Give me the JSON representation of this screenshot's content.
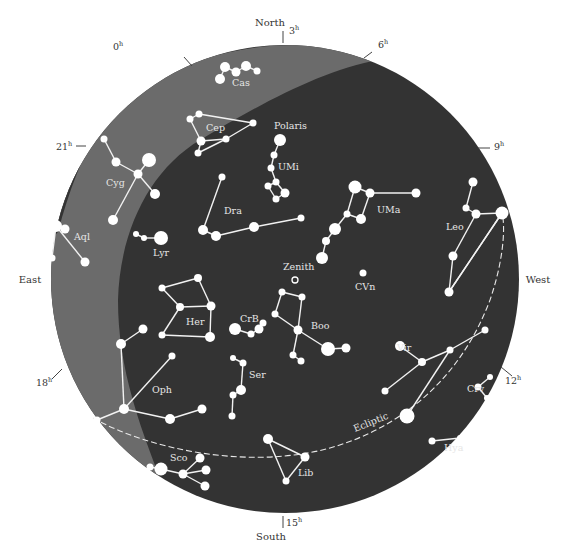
{
  "map": {
    "title": "Star map",
    "colors": {
      "sky": "#333333",
      "milky_way": "#6b6b6b",
      "background": "#ffffff",
      "star": "#ffffff",
      "line": "#f2f2f2"
    },
    "directions": [
      {
        "id": "north",
        "label": "North",
        "x": 270,
        "y": 26
      },
      {
        "id": "south",
        "label": "South",
        "x": 271,
        "y": 540
      },
      {
        "id": "east",
        "label": "East",
        "x": 30,
        "y": 283
      },
      {
        "id": "west",
        "label": "West",
        "x": 538,
        "y": 283
      }
    ],
    "hour_marks": [
      {
        "label": "0",
        "x": 113,
        "y": 50,
        "tx1": 184,
        "ty1": 57,
        "tx2": 192,
        "ty2": 66
      },
      {
        "label": "3",
        "x": 289,
        "y": 34,
        "tx1": 283,
        "ty1": 31,
        "tx2": 283,
        "ty2": 43
      },
      {
        "label": "6",
        "x": 378,
        "y": 48,
        "tx1": 369,
        "ty1": 53,
        "tx2": 369,
        "ty2": 53
      },
      {
        "label": "9",
        "x": 494,
        "y": 150,
        "tx1": 478,
        "ty1": 148,
        "tx2": 490,
        "ty2": 148
      },
      {
        "label": "12",
        "x": 505,
        "y": 384,
        "tx1": 501,
        "ty1": 367,
        "tx2": 512,
        "ty2": 376
      },
      {
        "label": "15",
        "x": 286,
        "y": 526,
        "tx1": 283,
        "ty1": 516,
        "tx2": 283,
        "ty2": 528
      },
      {
        "label": "18",
        "x": 36,
        "y": 386,
        "tx1": 52,
        "ty1": 379,
        "tx2": 62,
        "ty2": 369
      },
      {
        "label": "21",
        "x": 56,
        "y": 150,
        "tx1": 76,
        "ty1": 146,
        "tx2": 86,
        "ty2": 146
      }
    ],
    "hour_superscript": "h",
    "zenith": {
      "label": "Zenith",
      "x": 295,
      "y": 280,
      "lx": 283,
      "ly": 270
    },
    "ecliptic": {
      "label": "Ecliptic",
      "x": 355,
      "y": 432,
      "rotate": -22
    },
    "constellations": [
      {
        "name": "Cas",
        "lx": 232,
        "ly": 86,
        "stars": [
          [
            220,
            79,
            5
          ],
          [
            225,
            67,
            5
          ],
          [
            236,
            72,
            4.5
          ],
          [
            246,
            66,
            5
          ],
          [
            257,
            71,
            3.5
          ]
        ],
        "lines": [
          [
            0,
            1
          ],
          [
            1,
            2
          ],
          [
            2,
            3
          ],
          [
            3,
            4
          ]
        ]
      },
      {
        "name": "Cep",
        "lx": 206,
        "ly": 131,
        "stars": [
          [
            190,
            119,
            3.5
          ],
          [
            199,
            114,
            3.5
          ],
          [
            253,
            123,
            3.5
          ],
          [
            226,
            139,
            3.5
          ],
          [
            201,
            141,
            4.5
          ],
          [
            198,
            153,
            3.5
          ]
        ],
        "lines": [
          [
            0,
            1
          ],
          [
            1,
            2
          ],
          [
            2,
            3
          ],
          [
            3,
            4
          ],
          [
            4,
            5
          ],
          [
            0,
            4
          ],
          [
            5,
            3
          ]
        ]
      },
      {
        "name": "Polaris",
        "lx": 274,
        "ly": 129,
        "stars": [],
        "lines": []
      },
      {
        "name": "UMi",
        "lx": 278,
        "ly": 170,
        "stars": [
          [
            280,
            140,
            6
          ],
          [
            274,
            155,
            3.5
          ],
          [
            271,
            168,
            3.5
          ],
          [
            276,
            182,
            3.5
          ],
          [
            268,
            186,
            3.5
          ],
          [
            285,
            193,
            4.5
          ],
          [
            276,
            199,
            3.5
          ]
        ],
        "lines": [
          [
            0,
            1
          ],
          [
            1,
            2
          ],
          [
            2,
            3
          ],
          [
            3,
            4
          ],
          [
            3,
            5
          ],
          [
            5,
            6
          ],
          [
            6,
            4
          ]
        ]
      },
      {
        "name": "Dra",
        "lx": 224,
        "ly": 214,
        "stars": [
          [
            222,
            177,
            3.5
          ],
          [
            203,
            230,
            5
          ],
          [
            216,
            236,
            5
          ],
          [
            254,
            227,
            5
          ],
          [
            301,
            218,
            3.5
          ]
        ],
        "lines": [
          [
            0,
            1
          ],
          [
            1,
            2
          ],
          [
            2,
            3
          ],
          [
            3,
            4
          ]
        ]
      },
      {
        "name": "UMa",
        "lx": 377,
        "ly": 213,
        "stars": [
          [
            355,
            187,
            6.5
          ],
          [
            370,
            193,
            4.5
          ],
          [
            416,
            193,
            4.5
          ],
          [
            347,
            214,
            3.5
          ],
          [
            361,
            219,
            5
          ],
          [
            335,
            229,
            6
          ],
          [
            326,
            241,
            4
          ],
          [
            322,
            258,
            6
          ]
        ],
        "lines": [
          [
            0,
            1
          ],
          [
            1,
            2
          ],
          [
            0,
            3
          ],
          [
            1,
            4
          ],
          [
            3,
            4
          ],
          [
            3,
            5
          ],
          [
            5,
            6
          ],
          [
            6,
            7
          ]
        ]
      },
      {
        "name": "CVn",
        "lx": 355,
        "ly": 290,
        "stars": [
          [
            363,
            273,
            3.5
          ]
        ],
        "lines": []
      },
      {
        "name": "Leo",
        "lx": 446,
        "ly": 230,
        "stars": [
          [
            473,
            182,
            4.5
          ],
          [
            466,
            208,
            3.5
          ],
          [
            476,
            214,
            4.5
          ],
          [
            502,
            213,
            6.5
          ],
          [
            453,
            256,
            4.5
          ],
          [
            449,
            292,
            4.5
          ]
        ],
        "lines": [
          [
            0,
            1
          ],
          [
            1,
            2
          ],
          [
            2,
            3
          ],
          [
            2,
            4
          ],
          [
            4,
            5
          ],
          [
            5,
            3
          ]
        ]
      },
      {
        "name": "Cyg",
        "lx": 106,
        "ly": 186,
        "stars": [
          [
            104,
            139,
            3.5
          ],
          [
            116,
            162,
            4.5
          ],
          [
            149,
            160,
            7
          ],
          [
            138,
            174,
            4.5
          ],
          [
            155,
            194,
            5
          ],
          [
            113,
            220,
            5
          ]
        ],
        "lines": [
          [
            0,
            1
          ],
          [
            1,
            3
          ],
          [
            2,
            3
          ],
          [
            3,
            4
          ],
          [
            3,
            5
          ]
        ]
      },
      {
        "name": "Aql",
        "lx": 74,
        "ly": 240,
        "stars": [
          [
            56,
            226,
            6
          ],
          [
            65,
            229,
            4.5
          ],
          [
            52,
            258,
            3.5
          ],
          [
            85,
            262,
            4.5
          ]
        ],
        "lines": [
          [
            0,
            1
          ],
          [
            0,
            2
          ],
          [
            0,
            3
          ]
        ]
      },
      {
        "name": "Lyr",
        "lx": 153,
        "ly": 256,
        "stars": [
          [
            136,
            234,
            3
          ],
          [
            144,
            238,
            3
          ],
          [
            161,
            238,
            7
          ]
        ],
        "lines": [
          [
            0,
            1
          ],
          [
            1,
            2
          ]
        ]
      },
      {
        "name": "Her",
        "lx": 186,
        "ly": 325,
        "stars": [
          [
            162,
            288,
            3.5
          ],
          [
            198,
            278,
            4
          ],
          [
            180,
            307,
            4
          ],
          [
            211,
            306,
            4.5
          ],
          [
            162,
            335,
            3.5
          ],
          [
            210,
            337,
            5
          ]
        ],
        "lines": [
          [
            0,
            2
          ],
          [
            1,
            3
          ],
          [
            0,
            1
          ],
          [
            2,
            3
          ],
          [
            2,
            4
          ],
          [
            4,
            5
          ],
          [
            3,
            5
          ]
        ]
      },
      {
        "name": "CrB",
        "lx": 240,
        "ly": 322,
        "stars": [
          [
            235,
            329,
            6
          ],
          [
            251,
            334,
            3.5
          ],
          [
            259,
            329,
            4.5
          ],
          [
            263,
            323,
            3.5
          ]
        ],
        "lines": [
          [
            0,
            1
          ],
          [
            1,
            2
          ],
          [
            2,
            3
          ]
        ]
      },
      {
        "name": "Boo",
        "lx": 311,
        "ly": 329,
        "stars": [
          [
            282,
            292,
            3.5
          ],
          [
            302,
            297,
            3.5
          ],
          [
            275,
            314,
            3.5
          ],
          [
            298,
            330,
            4.5
          ],
          [
            328,
            349,
            7
          ],
          [
            346,
            348,
            4.5
          ],
          [
            293,
            355,
            3.5
          ],
          [
            301,
            361,
            3.5
          ]
        ],
        "lines": [
          [
            0,
            1
          ],
          [
            0,
            2
          ],
          [
            1,
            3
          ],
          [
            2,
            3
          ],
          [
            3,
            4
          ],
          [
            4,
            5
          ],
          [
            3,
            6
          ],
          [
            6,
            7
          ]
        ]
      },
      {
        "name": "Ser",
        "lx": 249,
        "ly": 378,
        "stars": [
          [
            233,
            358,
            3
          ],
          [
            243,
            363,
            3.5
          ],
          [
            241,
            390,
            5
          ],
          [
            233,
            395,
            3.5
          ],
          [
            232,
            416,
            3.5
          ]
        ],
        "lines": [
          [
            0,
            1
          ],
          [
            1,
            2
          ],
          [
            2,
            3
          ],
          [
            3,
            4
          ]
        ]
      },
      {
        "name": "Oph",
        "lx": 152,
        "ly": 393,
        "stars": [
          [
            143,
            329,
            4.5
          ],
          [
            121,
            344,
            5
          ],
          [
            172,
            356,
            3.5
          ],
          [
            124,
            409,
            5
          ],
          [
            170,
            419,
            5
          ],
          [
            202,
            409,
            4.5
          ],
          [
            97,
            420,
            3.5
          ]
        ],
        "lines": [
          [
            0,
            1
          ],
          [
            1,
            3
          ],
          [
            2,
            3
          ],
          [
            3,
            4
          ],
          [
            4,
            5
          ],
          [
            3,
            6
          ]
        ]
      },
      {
        "name": "Sco",
        "lx": 170,
        "ly": 461,
        "stars": [
          [
            150,
            467,
            3.5
          ],
          [
            161,
            469,
            6.5
          ],
          [
            183,
            474,
            4.5
          ],
          [
            200,
            458,
            4.5
          ],
          [
            206,
            470,
            4.5
          ],
          [
            205,
            486,
            4.5
          ]
        ],
        "lines": [
          [
            0,
            1
          ],
          [
            1,
            2
          ],
          [
            2,
            3
          ],
          [
            2,
            4
          ],
          [
            2,
            5
          ]
        ]
      },
      {
        "name": "Lib",
        "lx": 298,
        "ly": 476,
        "stars": [
          [
            268,
            439,
            5
          ],
          [
            305,
            457,
            4.5
          ],
          [
            286,
            481,
            3.5
          ]
        ],
        "lines": [
          [
            0,
            1
          ],
          [
            0,
            2
          ],
          [
            1,
            2
          ]
        ]
      },
      {
        "name": "Vir",
        "lx": 397,
        "ly": 351,
        "stars": [
          [
            400,
            346,
            5
          ],
          [
            422,
            362,
            4
          ],
          [
            450,
            350,
            3.5
          ],
          [
            485,
            330,
            3.5
          ],
          [
            385,
            391,
            3.5
          ]
        ],
        "lines": [
          [
            0,
            1
          ],
          [
            1,
            2
          ],
          [
            2,
            3
          ],
          [
            1,
            4
          ]
        ]
      },
      {
        "name": "Crv",
        "lx": 467,
        "ly": 392,
        "stars": [
          [
            478,
            387,
            3.5
          ],
          [
            490,
            377,
            3
          ],
          [
            487,
            398,
            3
          ]
        ],
        "lines": [
          [
            0,
            1
          ],
          [
            0,
            2
          ]
        ]
      },
      {
        "name": "Hya",
        "lx": 444,
        "ly": 451,
        "stars": [
          [
            432,
            441,
            3.5
          ],
          [
            460,
            438,
            3
          ],
          [
            407,
            416,
            7.5
          ]
        ],
        "lines": [
          [
            0,
            1
          ],
          [
            2,
            2
          ]
        ]
      }
    ],
    "extra_lines": [
      {
        "from": [
          407,
          416
        ],
        "to": [
          450,
          350
        ]
      },
      {
        "from": [
          502,
          213
        ],
        "to": [
          449,
          292
        ]
      }
    ]
  }
}
